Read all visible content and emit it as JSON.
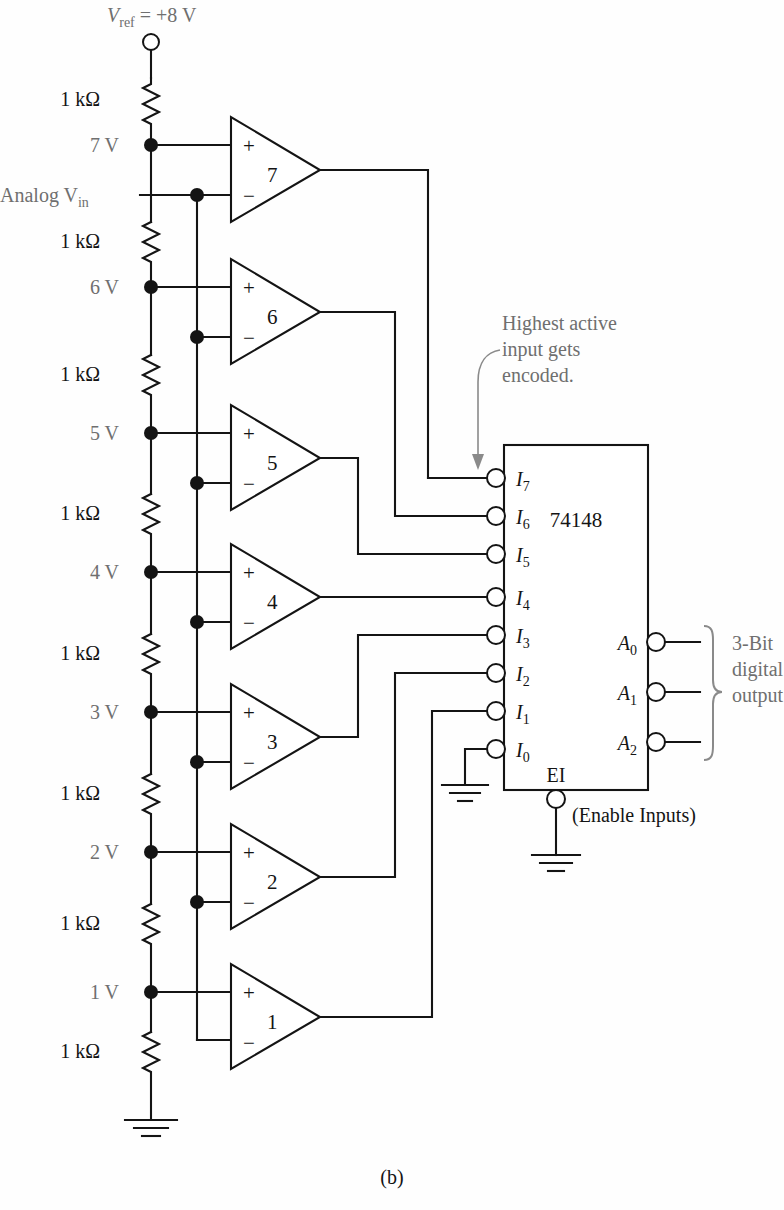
{
  "figure": {
    "caption": "(b)",
    "chip_label": "74148",
    "vref_label": "Vref = +8 V",
    "vref_main": "V",
    "vref_sub": "ref",
    "vref_rest": " = +8 V",
    "analog_in_main": "Analog V",
    "analog_in_sub": "in",
    "annotation_line1": "Highest active",
    "annotation_line2": "input gets",
    "annotation_line3": "encoded.",
    "enable_label": "EI",
    "enable_note": "(Enable Inputs)",
    "output_note_line1": "3-Bit",
    "output_note_line2": "digital",
    "output_note_line3": "output",
    "colors": {
      "wire": "#141414",
      "label_gray": "#6f6f6f",
      "label_dark": "#141414",
      "background": "#ffffff"
    }
  },
  "ladder": {
    "resistors": [
      {
        "label": "1 kΩ",
        "y": 100
      },
      {
        "label": "1 kΩ",
        "y": 240
      },
      {
        "label": "1 kΩ",
        "y": 380
      },
      {
        "label": "1 kΩ",
        "y": 500
      },
      {
        "label": "1 kΩ",
        "y": 640
      },
      {
        "label": "1 kΩ",
        "y": 780
      },
      {
        "label": "1 kΩ",
        "y": 910
      },
      {
        "label": "1 kΩ",
        "y": 1040
      }
    ],
    "nodes": [
      {
        "label": "7 V",
        "y": 145
      },
      {
        "label": "6 V",
        "y": 287
      },
      {
        "label": "5 V",
        "y": 433
      },
      {
        "label": "4 V",
        "y": 572
      },
      {
        "label": "3 V",
        "y": 712
      },
      {
        "label": "2 V",
        "y": 852
      },
      {
        "label": "1 V",
        "y": 992
      }
    ]
  },
  "comparators": [
    {
      "number": "7",
      "plus": "+",
      "minus": "−"
    },
    {
      "number": "6",
      "plus": "+",
      "minus": "−"
    },
    {
      "number": "5",
      "plus": "+",
      "minus": "−"
    },
    {
      "number": "4",
      "plus": "+",
      "minus": "−"
    },
    {
      "number": "3",
      "plus": "+",
      "minus": "−"
    },
    {
      "number": "2",
      "plus": "+",
      "minus": "−"
    },
    {
      "number": "1",
      "plus": "+",
      "minus": "−"
    }
  ],
  "encoder": {
    "name": "74148",
    "inputs": [
      {
        "main": "I",
        "sub": "7"
      },
      {
        "main": "I",
        "sub": "6"
      },
      {
        "main": "I",
        "sub": "5"
      },
      {
        "main": "I",
        "sub": "4"
      },
      {
        "main": "I",
        "sub": "3"
      },
      {
        "main": "I",
        "sub": "2"
      },
      {
        "main": "I",
        "sub": "1"
      },
      {
        "main": "I",
        "sub": "0"
      }
    ],
    "outputs": [
      {
        "main": "A",
        "sub": "0"
      },
      {
        "main": "A",
        "sub": "1"
      },
      {
        "main": "A",
        "sub": "2"
      }
    ]
  }
}
